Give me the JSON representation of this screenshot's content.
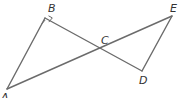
{
  "diagram": {
    "type": "geometry",
    "points": {
      "A": {
        "label": "A",
        "x": 7,
        "y": 89
      },
      "B": {
        "label": "B",
        "x": 45,
        "y": 18
      },
      "C": {
        "label": "C",
        "x": 104,
        "y": 48
      },
      "D": {
        "label": "D",
        "x": 142,
        "y": 71
      },
      "E": {
        "label": "E",
        "x": 172,
        "y": 16
      }
    },
    "segments": [
      "AB",
      "BD",
      "AE",
      "DE"
    ],
    "right_angle_at": "B",
    "labels": {
      "A": "A",
      "B": "B",
      "C": "C",
      "D": "D",
      "E": "E"
    },
    "line_color": "#6b6b6b"
  }
}
